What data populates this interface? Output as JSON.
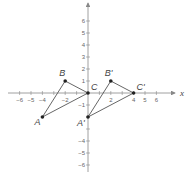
{
  "diagram": {
    "type": "coordinate-plane-translation",
    "axes": {
      "x_label": "x",
      "x_ticks": [
        -6,
        -5,
        -4,
        -2,
        2,
        4,
        5,
        6
      ],
      "y_ticks": [
        6,
        5,
        4,
        3,
        2,
        1,
        -1,
        -4,
        -5,
        -6
      ],
      "x_range": [
        -7,
        7
      ],
      "y_range": [
        -7,
        7
      ]
    },
    "triangles": [
      {
        "name": "ABC",
        "points": [
          {
            "label": "A",
            "x": -4,
            "y": -2
          },
          {
            "label": "B",
            "x": -2,
            "y": 1
          },
          {
            "label": "C",
            "x": 0,
            "y": 0
          }
        ]
      },
      {
        "name": "A'B'C'",
        "points": [
          {
            "label": "A'",
            "x": 0,
            "y": -2
          },
          {
            "label": "B'",
            "x": 2,
            "y": 1
          },
          {
            "label": "C'",
            "x": 4,
            "y": 0
          }
        ]
      }
    ],
    "colors": {
      "axis": "#888888",
      "lines": "#555555",
      "points": "#222222",
      "text": "#444444"
    }
  }
}
